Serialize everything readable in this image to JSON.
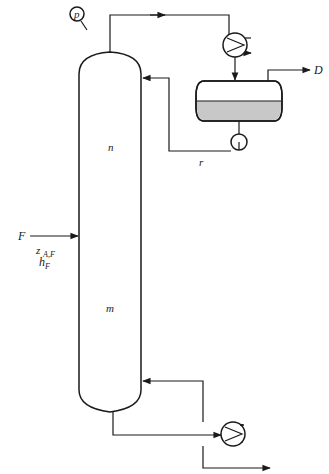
{
  "diagram": {
    "type": "distillation-column-flowsheet",
    "labels": {
      "pressure_gauge": "p",
      "distillate": "D",
      "reflux": "r",
      "feed": "F",
      "feed_composition": "z",
      "feed_composition_sub": "A,F",
      "feed_enthalpy": "h",
      "feed_enthalpy_sub": "F",
      "rectifying_section": "n",
      "stripping_section": "m"
    },
    "components": [
      {
        "id": "column",
        "name": "Distillation column"
      },
      {
        "id": "condenser",
        "name": "Overhead condenser"
      },
      {
        "id": "accumulator",
        "name": "Reflux drum"
      },
      {
        "id": "pump",
        "name": "Reflux pump"
      },
      {
        "id": "reboiler",
        "name": "Reboiler"
      },
      {
        "id": "gauge",
        "name": "Pressure gauge"
      }
    ],
    "colors": {
      "stroke": "#1a1a1a",
      "liquid": "#c8c8c8",
      "background": "#ffffff"
    }
  }
}
